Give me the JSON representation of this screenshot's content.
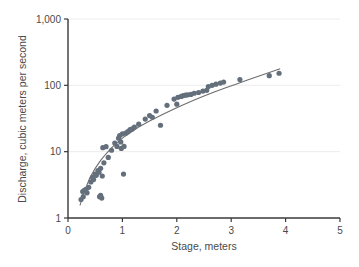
{
  "chart_data": {
    "type": "scatter",
    "title": "",
    "xlabel": "Stage, meters",
    "ylabel": "Discharge, cubic meters per second",
    "xlim": [
      0,
      5
    ],
    "ylim": [
      1,
      1000
    ],
    "yscale": "log",
    "xscale": "linear",
    "grid": "horizontal-faint",
    "legend": "none",
    "xticks": [
      0,
      1,
      2,
      3,
      4,
      5
    ],
    "xtick_labels": [
      "0",
      "1",
      "2",
      "3",
      "4",
      "5"
    ],
    "yticks": [
      1,
      10,
      100,
      1000
    ],
    "ytick_labels": [
      "1",
      "10",
      "100",
      "1,000"
    ],
    "marker_color": "#646f7c",
    "curve_color": "#6e6e6e",
    "series": [
      {
        "name": "Stage-discharge measurements",
        "points": [
          [
            0.24,
            1.9
          ],
          [
            0.27,
            2.5
          ],
          [
            0.28,
            2.1
          ],
          [
            0.3,
            2.6
          ],
          [
            0.33,
            2.7
          ],
          [
            0.35,
            2.4
          ],
          [
            0.38,
            2.9
          ],
          [
            0.42,
            3.5
          ],
          [
            0.45,
            4.1
          ],
          [
            0.47,
            3.8
          ],
          [
            0.5,
            4.6
          ],
          [
            0.52,
            4.4
          ],
          [
            0.55,
            5.2
          ],
          [
            0.57,
            4.9
          ],
          [
            0.58,
            2.1
          ],
          [
            0.6,
            2.2
          ],
          [
            0.6,
            5.6
          ],
          [
            0.62,
            2.0
          ],
          [
            0.63,
            4.3
          ],
          [
            0.64,
            11.5
          ],
          [
            0.66,
            6.8
          ],
          [
            0.7,
            11.9
          ],
          [
            0.74,
            8.2
          ],
          [
            0.8,
            10.5
          ],
          [
            0.86,
            13.5
          ],
          [
            0.9,
            12.0
          ],
          [
            0.93,
            16.0
          ],
          [
            0.95,
            17.5
          ],
          [
            0.97,
            14.0
          ],
          [
            0.98,
            11.2
          ],
          [
            1.0,
            18.5
          ],
          [
            1.02,
            4.6
          ],
          [
            1.03,
            12.0
          ],
          [
            1.06,
            19.0
          ],
          [
            1.1,
            20.0
          ],
          [
            1.14,
            21.5
          ],
          [
            1.18,
            22.0
          ],
          [
            1.22,
            23.5
          ],
          [
            1.3,
            26.0
          ],
          [
            1.42,
            31.0
          ],
          [
            1.5,
            35.0
          ],
          [
            1.55,
            33.0
          ],
          [
            1.62,
            41.0
          ],
          [
            1.7,
            25.0
          ],
          [
            1.82,
            50.0
          ],
          [
            1.95,
            62.0
          ],
          [
            2.0,
            52.0
          ],
          [
            2.02,
            66.0
          ],
          [
            2.08,
            68.0
          ],
          [
            2.12,
            70.0
          ],
          [
            2.16,
            71.0
          ],
          [
            2.2,
            72.0
          ],
          [
            2.26,
            73.0
          ],
          [
            2.32,
            76.0
          ],
          [
            2.4,
            78.0
          ],
          [
            2.48,
            82.0
          ],
          [
            2.55,
            84.0
          ],
          [
            2.58,
            96.0
          ],
          [
            2.65,
            100.0
          ],
          [
            2.72,
            104.0
          ],
          [
            2.8,
            108.0
          ],
          [
            2.86,
            112.0
          ],
          [
            3.16,
            122.0
          ],
          [
            3.7,
            140.0
          ],
          [
            3.88,
            152.0
          ]
        ]
      }
    ],
    "fit_curve": {
      "name": "rating curve",
      "points": [
        [
          0.22,
          1.55
        ],
        [
          0.3,
          2.5
        ],
        [
          0.4,
          4.0
        ],
        [
          0.5,
          5.6
        ],
        [
          0.6,
          7.4
        ],
        [
          0.7,
          9.3
        ],
        [
          0.8,
          11.4
        ],
        [
          0.9,
          13.6
        ],
        [
          1.0,
          16.0
        ],
        [
          1.15,
          19.5
        ],
        [
          1.3,
          23.5
        ],
        [
          1.5,
          29.0
        ],
        [
          1.7,
          35.0
        ],
        [
          1.9,
          42.0
        ],
        [
          2.1,
          50.0
        ],
        [
          2.3,
          59.0
        ],
        [
          2.5,
          69.0
        ],
        [
          2.7,
          80.0
        ],
        [
          2.9,
          92.0
        ],
        [
          3.1,
          105.0
        ],
        [
          3.3,
          120.0
        ],
        [
          3.5,
          137.0
        ],
        [
          3.7,
          156.0
        ],
        [
          3.9,
          178.0
        ]
      ]
    }
  },
  "axes": {
    "x_title": "Stage, meters",
    "y_title": "Discharge, cubic meters per second"
  }
}
